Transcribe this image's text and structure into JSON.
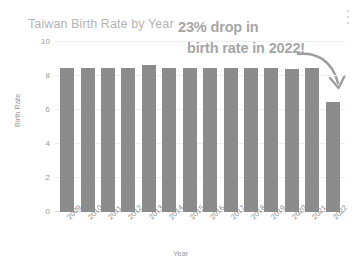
{
  "chart_data": {
    "type": "bar",
    "title": "Taiwan Birth Rate by Year",
    "xlabel": "Year",
    "ylabel": "Birth Rate",
    "ylim": [
      0,
      10
    ],
    "yticks": [
      0,
      2,
      4,
      6,
      8,
      10
    ],
    "grid": true,
    "legend": "none",
    "categories": [
      "2009",
      "2010",
      "2011",
      "2012",
      "2013",
      "2014",
      "2015",
      "2016",
      "2017",
      "2018",
      "2019",
      "2020",
      "2021",
      "2022"
    ],
    "values": [
      8.45,
      8.5,
      8.5,
      8.5,
      8.65,
      8.5,
      8.5,
      8.5,
      8.45,
      8.45,
      8.45,
      8.4,
      8.45,
      6.5
    ],
    "series": [
      {
        "name": "Birth Rate",
        "values": [
          8.45,
          8.5,
          8.5,
          8.5,
          8.65,
          8.5,
          8.5,
          8.5,
          8.45,
          8.45,
          8.45,
          8.4,
          8.45,
          6.5
        ]
      }
    ],
    "annotations": [
      {
        "text_line_1": "23% drop in",
        "text_line_2": "birth rate in 2022!",
        "points_to": "2022"
      }
    ],
    "colors": {
      "bar": "#8c8c8c",
      "title": "#b4b4b4",
      "annotation": "#a6a6a6",
      "grid": "#eeeeee",
      "axis_text": "#9a9a9a",
      "background": "#ffffff"
    }
  },
  "annotation": {
    "line1": "23% drop in",
    "line2": "birth rate in 2022!"
  },
  "toolbar": {
    "more_options_label": "More options"
  }
}
